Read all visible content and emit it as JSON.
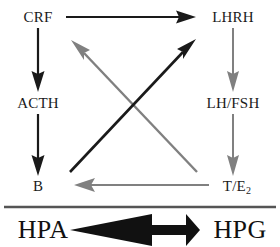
{
  "diagram": {
    "colors": {
      "black": "#1a1a1a",
      "gray": "#808080",
      "divider": "#555555",
      "background": "#ffffff"
    },
    "nodes": [
      {
        "id": "crf",
        "label": "CRF",
        "x": 38,
        "y": 17
      },
      {
        "id": "lhrh",
        "label": "LHRH",
        "x": 233,
        "y": 17
      },
      {
        "id": "acth",
        "label": "ACTH",
        "x": 38,
        "y": 103
      },
      {
        "id": "lhfsh",
        "label": "LH/FSH",
        "x": 233,
        "y": 103
      },
      {
        "id": "b",
        "label": "B",
        "x": 38,
        "y": 186
      },
      {
        "id": "te2",
        "label": "T/E",
        "sub": "2",
        "x": 237,
        "y": 186
      }
    ],
    "system_labels": [
      {
        "id": "hpa",
        "label": "HPA",
        "x": 43,
        "y": 230
      },
      {
        "id": "hpg",
        "label": "HPG",
        "x": 240,
        "y": 230
      }
    ],
    "edges": [
      {
        "id": "crf-to-lhrh",
        "from": "CRF",
        "to": "LHRH",
        "color": "black",
        "direction": "right"
      },
      {
        "id": "crf-to-acth",
        "from": "CRF",
        "to": "ACTH",
        "color": "black",
        "direction": "down"
      },
      {
        "id": "acth-to-b",
        "from": "ACTH",
        "to": "B",
        "color": "black",
        "direction": "down"
      },
      {
        "id": "lhrh-to-lhfsh",
        "from": "LHRH",
        "to": "LH/FSH",
        "color": "gray",
        "direction": "down"
      },
      {
        "id": "lhfsh-to-te2",
        "from": "LH/FSH",
        "to": "T/E2",
        "color": "gray",
        "direction": "down"
      },
      {
        "id": "te2-to-b",
        "from": "T/E2",
        "to": "B",
        "color": "gray",
        "direction": "left"
      },
      {
        "id": "te2-to-crf",
        "from": "T/E2",
        "to": "CRF",
        "color": "gray",
        "direction": "diagonal-up-left"
      },
      {
        "id": "b-to-lhrh",
        "from": "B",
        "to": "LHRH",
        "color": "black",
        "direction": "diagonal-up-right"
      }
    ],
    "divider": {
      "id": "axis-divider",
      "y": 207
    },
    "system_arrow": {
      "id": "hpa-hpg-bidirectional-arrow",
      "type": "double-headed",
      "color": "black"
    }
  }
}
